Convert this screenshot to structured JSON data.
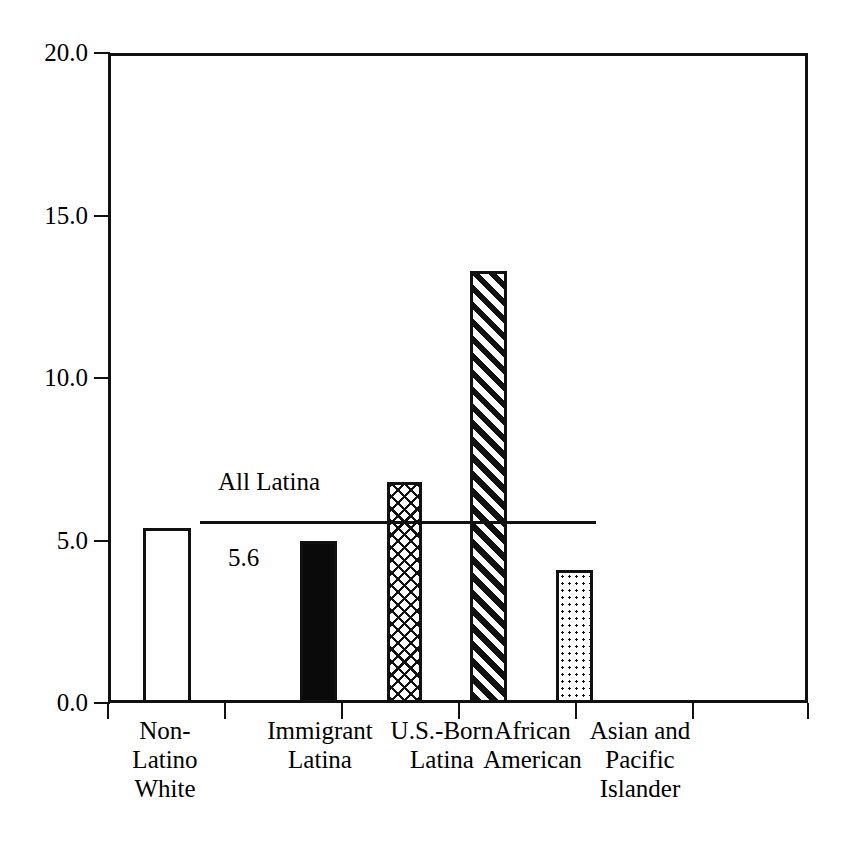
{
  "chart_data": {
    "type": "bar",
    "title": "",
    "subtitle": "",
    "xlabel": "",
    "ylabel": "",
    "ylim": [
      0.0,
      20.0
    ],
    "ytick_labels": [
      "20.0",
      "15.0",
      "10.0",
      "5.0",
      "0.0"
    ],
    "ytick_values": [
      20.0,
      15.0,
      10.0,
      5.0,
      0.0
    ],
    "grid": false,
    "legend": "none",
    "categories": [
      "Non-\nLatino\nWhite",
      "Immigrant\nLatina",
      "U.S.-Born\nLatina",
      "African\nAmerican",
      "Asian and\nPacific\nIslander"
    ],
    "values": [
      5.4,
      5.0,
      6.8,
      13.3,
      4.1
    ],
    "bar_fills": [
      "open",
      "solid",
      "crosshatch",
      "diagonal-hatch",
      "dotted"
    ],
    "annotations": [
      {
        "kind": "reference-line",
        "label": "All Latina",
        "value_label": "5.6",
        "value": 5.6
      }
    ]
  },
  "axis": {
    "y_ticks": [
      {
        "label": "20.0",
        "value": 20.0
      },
      {
        "label": "15.0",
        "value": 15.0
      },
      {
        "label": "10.0",
        "value": 10.0
      },
      {
        "label": "5.0",
        "value": 5.0
      },
      {
        "label": "0.0",
        "value": 0.0
      }
    ]
  },
  "bars": [
    {
      "label": "Non-\nLatino\nWhite",
      "value": 5.4,
      "fill": "open"
    },
    {
      "label": "Immigrant\nLatina",
      "value": 5.0,
      "fill": "solid"
    },
    {
      "label": "U.S.-Born\nLatina",
      "value": 6.8,
      "fill": "crosshatch"
    },
    {
      "label": "African\nAmerican",
      "value": 13.3,
      "fill": "diagonal-hatch"
    },
    {
      "label": "Asian and\nPacific\nIslander",
      "value": 4.1,
      "fill": "dotted"
    }
  ],
  "reference": {
    "name": "All Latina",
    "value_label": "5.6"
  },
  "colors": {
    "ink": "#111111",
    "background": "#ffffff"
  }
}
